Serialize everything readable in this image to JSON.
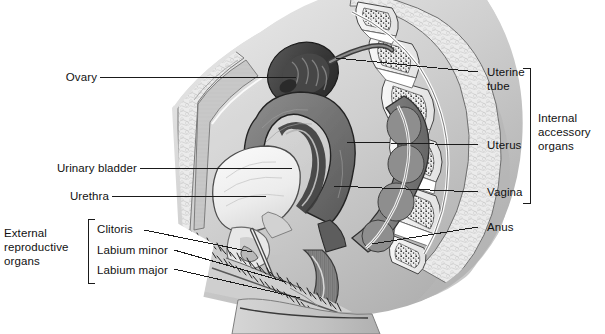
{
  "figure": {
    "type": "anatomical-illustration",
    "view": "sagittal section",
    "style": "grayscale halftone medical drawing",
    "width": 605,
    "height": 334,
    "background": "#ffffff",
    "text_color": "#111111",
    "leader_color": "#1a1a1a"
  },
  "labels": {
    "ovary": "Ovary",
    "urinary_bladder": "Urinary bladder",
    "urethra": "Urethra",
    "clitoris": "Clitoris",
    "labium_minor": "Labium minor",
    "labium_major": "Labium major",
    "uterine_tube_line1": "Uterine",
    "uterine_tube_line2": "tube",
    "uterus": "Uterus",
    "vagina": "Vagina",
    "anus": "Anus"
  },
  "groups": {
    "external": {
      "line1": "External",
      "line2": "reproductive",
      "line3": "organs"
    },
    "internal": {
      "line1": "Internal",
      "line2": "accessory",
      "line3": "organs"
    }
  }
}
